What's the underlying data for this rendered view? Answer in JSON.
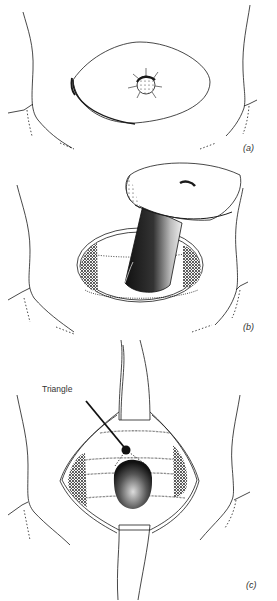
{
  "figure": {
    "panels": [
      {
        "id": "a",
        "label": "(a)"
      },
      {
        "id": "b",
        "label": "(b)"
      },
      {
        "id": "c",
        "label": "(c)"
      }
    ],
    "annotations": {
      "triangle": "Triangle"
    },
    "colors": {
      "ink": "#1a1a1a",
      "background": "#ffffff"
    }
  }
}
